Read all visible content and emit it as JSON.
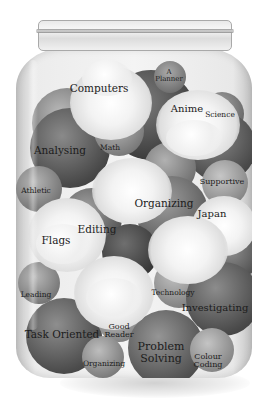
{
  "illustration": {
    "subject": "jar of labelled spheres and clouds",
    "palette": {
      "background": "#ffffff",
      "sphere_dark": "#3f3f3f",
      "sphere_mid": "#7a7a7a",
      "sphere_light": "#b5b5b5",
      "cloud": "#f2f2f2",
      "text": "#1c1c1c"
    },
    "labels": {
      "computers": "Computers",
      "a_planner": "A\nPlanner",
      "a_planner_line1": "A",
      "a_planner_line2": "Planner",
      "anime": "Anime",
      "science": "Science",
      "analysing": "Analysing",
      "math": "Math",
      "athletic": "Athletic",
      "supportive": "Supportive",
      "organizing_mid": "Organizing",
      "japan": "Japan",
      "editing": "Editing",
      "flags": "Flags",
      "leading": "Leading",
      "technology": "Technology",
      "investigating": "Investigating",
      "task_oriented": "Task Oriented",
      "good_reader_line1": "Good",
      "good_reader_line2": "Reader",
      "organizing_low": "Organizing",
      "problem_solving_line1": "Problem",
      "problem_solving_line2": "Solving",
      "colour_coding_line1": "Colour",
      "colour_coding_line2": "Coding"
    }
  }
}
